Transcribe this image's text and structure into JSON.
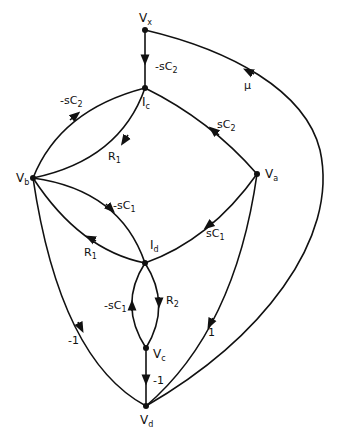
{
  "diagram": {
    "type": "signal-flow-graph",
    "nodes": [
      {
        "id": "Vx",
        "label": "V",
        "sub": "x",
        "x": 145,
        "y": 30
      },
      {
        "id": "Ic",
        "label": "I",
        "sub": "c",
        "x": 145,
        "y": 88
      },
      {
        "id": "Vb",
        "label": "V",
        "sub": "b",
        "x": 33,
        "y": 178
      },
      {
        "id": "Va",
        "label": "V",
        "sub": "a",
        "x": 257,
        "y": 174
      },
      {
        "id": "Id",
        "label": "I",
        "sub": "d",
        "x": 145,
        "y": 263
      },
      {
        "id": "Vc",
        "label": "V",
        "sub": "c",
        "x": 146,
        "y": 348
      },
      {
        "id": "Vd",
        "label": "V",
        "sub": "d",
        "x": 146,
        "y": 406
      }
    ],
    "edges": [
      {
        "from": "Vx",
        "to": "Ic",
        "gain": "-sC",
        "sub": "2"
      },
      {
        "from": "Vb",
        "to": "Ic",
        "gain": "-sC",
        "sub": "2"
      },
      {
        "from": "Ic",
        "to": "Vb",
        "gain": "R",
        "sub": "1"
      },
      {
        "from": "Va",
        "to": "Ic",
        "gain": "sC",
        "sub": "2"
      },
      {
        "from": "Vb",
        "to": "Id",
        "gain": "-sC",
        "sub": "1"
      },
      {
        "from": "Id",
        "to": "Vb",
        "gain": "R",
        "sub": "1"
      },
      {
        "from": "Va",
        "to": "Id",
        "gain": "sC",
        "sub": "1"
      },
      {
        "from": "Id",
        "to": "Vc",
        "gain": "R",
        "sub": "2"
      },
      {
        "from": "Vc",
        "to": "Id",
        "gain": "-sC",
        "sub": "1"
      },
      {
        "from": "Vc",
        "to": "Vd",
        "gain": "-1",
        "sub": ""
      },
      {
        "from": "Vb",
        "to": "Vd",
        "gain": "-1",
        "sub": ""
      },
      {
        "from": "Va",
        "to": "Vd",
        "gain": "1",
        "sub": ""
      },
      {
        "from": "Vd",
        "to": "Vx",
        "gain": "μ",
        "sub": ""
      }
    ]
  },
  "labels": {
    "vx": "V",
    "vx_sub": "x",
    "ic": "I",
    "ic_sub": "c",
    "vb": "V",
    "vb_sub": "b",
    "va": "V",
    "va_sub": "a",
    "id": "I",
    "id_sub": "d",
    "vc": "V",
    "vc_sub": "c",
    "vd": "V",
    "vd_sub": "d",
    "e_vx_ic": "-sC",
    "e_vx_ic_sub": "2",
    "e_vb_ic": "-sC",
    "e_vb_ic_sub": "2",
    "e_ic_vb": "R",
    "e_ic_vb_sub": "1",
    "e_va_ic": "sC",
    "e_va_ic_sub": "2",
    "e_vb_id": "-sC",
    "e_vb_id_sub": "1",
    "e_id_vb": "R",
    "e_id_vb_sub": "1",
    "e_va_id": "sC",
    "e_va_id_sub": "1",
    "e_id_vc": "R",
    "e_id_vc_sub": "2",
    "e_vc_id": "-sC",
    "e_vc_id_sub": "1",
    "e_vc_vd": "-1",
    "e_vb_vd": "-1",
    "e_va_vd": "1",
    "e_vd_vx": "μ"
  }
}
